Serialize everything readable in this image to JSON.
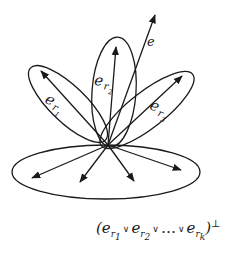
{
  "diagram": {
    "title": "",
    "stroke_color": "#1a1a1a",
    "background": "#ffffff",
    "origin": [
      108,
      145
    ],
    "nodes": [
      {
        "id": "e",
        "label": "e",
        "type": "vector",
        "tip": [
          155,
          15
        ]
      },
      {
        "id": "er1",
        "label": "e",
        "sub": "r",
        "subsub": "1",
        "type": "vector-in-petal",
        "tip": [
          41,
          71
        ]
      },
      {
        "id": "er2",
        "label": "e",
        "sub": "r",
        "subsub": "2",
        "type": "vector-in-petal",
        "tip": [
          116,
          47
        ]
      },
      {
        "id": "er3",
        "label": "e",
        "sub": "r",
        "subsub": "3",
        "type": "vector-in-petal",
        "tip": [
          182,
          76
        ]
      }
    ],
    "petals": [
      {
        "id": "petal-er1",
        "contains": "er1"
      },
      {
        "id": "petal-er2",
        "contains": "er2"
      },
      {
        "id": "petal-er3",
        "contains": "er3"
      }
    ],
    "complement_plane": {
      "id": "orthogonal-complement",
      "vectors": [
        [
          32,
          178
        ],
        [
          80,
          182
        ],
        [
          134,
          181
        ],
        [
          181,
          170
        ]
      ]
    },
    "formula": {
      "open": "(",
      "terms": [
        {
          "base": "e",
          "sub": "r",
          "subsub": "1"
        },
        {
          "base": "e",
          "sub": "r",
          "subsub": "2"
        },
        {
          "base": "…",
          "sub": "",
          "subsub": ""
        },
        {
          "base": "e",
          "sub": "r",
          "subsub": "k"
        }
      ],
      "operator": "∨",
      "close": ")",
      "superscript": "⊥"
    }
  }
}
